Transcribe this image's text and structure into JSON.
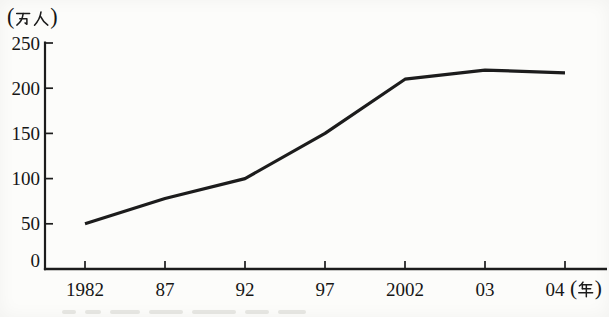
{
  "chart_data": {
    "type": "line",
    "title": "",
    "x_categories": [
      "1982",
      "87",
      "92",
      "97",
      "2002",
      "03",
      "04"
    ],
    "x_axis_unit": "(年)",
    "y_axis_unit": "(万人)",
    "y_ticks": [
      0,
      50,
      100,
      150,
      200,
      250
    ],
    "ylim": [
      0,
      250
    ],
    "series": [
      {
        "name": "population-line",
        "values": [
          50,
          78,
          100,
          150,
          210,
          220,
          217
        ]
      }
    ],
    "grid": false,
    "legend": "none",
    "colors": {
      "ink": "#1c1c1c",
      "text": "#161616",
      "background": "#fcfcfa",
      "caption_remnant": "#cfcfca"
    }
  }
}
